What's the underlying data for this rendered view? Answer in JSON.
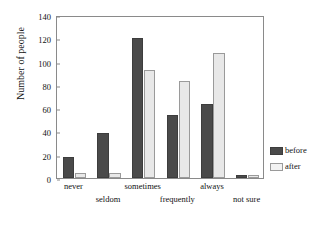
{
  "chart_data": {
    "type": "bar",
    "title": "",
    "xlabel": "",
    "ylabel": "Number of people",
    "ylim": [
      0,
      140
    ],
    "yticks": [
      0,
      20,
      40,
      60,
      80,
      100,
      120,
      140
    ],
    "grid": false,
    "legend_position": "right",
    "categories": [
      "never",
      "seldom",
      "sometimes",
      "frequently",
      "always",
      "not sure"
    ],
    "series": [
      {
        "name": "before",
        "color": "#4a4a4a",
        "values": [
          18,
          39,
          120,
          54,
          64,
          3
        ]
      },
      {
        "name": "after",
        "color": "#e8e8e8",
        "values": [
          4,
          4,
          93,
          83,
          107,
          3
        ]
      }
    ]
  },
  "legend": {
    "items": [
      {
        "label": "before"
      },
      {
        "label": "after"
      }
    ]
  }
}
